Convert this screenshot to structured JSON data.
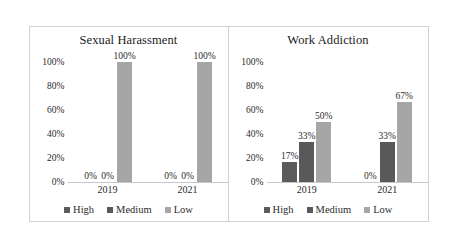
{
  "figure": {
    "background": "#ffffff",
    "border_color": "#d0d0d0"
  },
  "series_colors": {
    "High": "#5b5b5b",
    "Medium": "#595959",
    "Low": "#a6a6a6"
  },
  "legend": {
    "items": [
      {
        "label": "High",
        "color": "#5b5b5b",
        "marker": "square-swatch-icon"
      },
      {
        "label": "Medium",
        "color": "#595959",
        "marker": "square-swatch-icon"
      },
      {
        "label": "Low",
        "color": "#a6a6a6",
        "marker": "square-swatch-icon"
      }
    ]
  },
  "yticks": [
    "0%",
    "20%",
    "40%",
    "60%",
    "80%",
    "100%"
  ],
  "chart_data": [
    {
      "type": "bar",
      "title": "Sexual Harassment",
      "xlabel": "",
      "ylabel": "",
      "ylim": [
        0,
        100
      ],
      "ytick_values": [
        0,
        20,
        40,
        60,
        80,
        100
      ],
      "ytick_labels": [
        "0%",
        "20%",
        "40%",
        "60%",
        "80%",
        "100%"
      ],
      "categories": [
        "2019",
        "2021"
      ],
      "grid": false,
      "legend_position": "bottom",
      "series": [
        {
          "name": "High",
          "color": "#5b5b5b",
          "values": [
            0,
            0
          ],
          "labels": [
            "0%",
            "0%"
          ]
        },
        {
          "name": "Medium",
          "color": "#595959",
          "values": [
            0,
            0
          ],
          "labels": [
            "0%",
            "0%"
          ]
        },
        {
          "name": "Low",
          "color": "#a6a6a6",
          "values": [
            100,
            100
          ],
          "labels": [
            "100%",
            "100%"
          ]
        }
      ]
    },
    {
      "type": "bar",
      "title": "Work Addiction",
      "xlabel": "",
      "ylabel": "",
      "ylim": [
        0,
        100
      ],
      "ytick_values": [
        0,
        20,
        40,
        60,
        80,
        100
      ],
      "ytick_labels": [
        "0%",
        "20%",
        "40%",
        "60%",
        "80%",
        "100%"
      ],
      "categories": [
        "2019",
        "2021"
      ],
      "grid": false,
      "legend_position": "bottom",
      "series": [
        {
          "name": "High",
          "color": "#5b5b5b",
          "values": [
            17,
            0
          ],
          "labels": [
            "17%",
            "0%"
          ]
        },
        {
          "name": "Medium",
          "color": "#595959",
          "values": [
            33,
            33
          ],
          "labels": [
            "33%",
            "33%"
          ]
        },
        {
          "name": "Low",
          "color": "#a6a6a6",
          "values": [
            50,
            67
          ],
          "labels": [
            "50%",
            "67%"
          ]
        }
      ]
    }
  ]
}
